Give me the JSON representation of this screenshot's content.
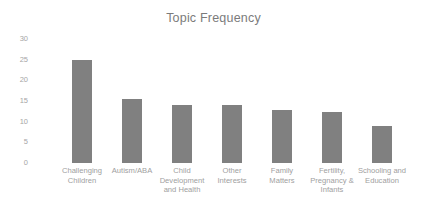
{
  "chart_data": {
    "type": "bar",
    "title": "Topic Frequency",
    "xlabel": "",
    "ylabel": "",
    "ylim": [
      0,
      30
    ],
    "yticks": [
      0,
      5,
      10,
      15,
      20,
      25,
      30
    ],
    "ytick_labels": [
      "0",
      "5",
      "10",
      "15",
      "20",
      "25",
      "30"
    ],
    "grid": false,
    "legend": false,
    "bar_color": "#808080",
    "title_color": "#7b7b7b",
    "tick_color": "#a6a6a6",
    "label_color": "#a0a0a0",
    "background": "#ffffff",
    "categories": [
      "Challenging\nChildren",
      "Autism/ABA",
      "Child\nDevelopment\nand Health",
      "Other\nInterests",
      "Family\nMatters",
      "Fertility,\nPregnancy &\nInfants",
      "Schooling and\nEducation"
    ],
    "values": [
      25,
      15.5,
      14,
      14,
      12.8,
      12.3,
      9
    ]
  }
}
